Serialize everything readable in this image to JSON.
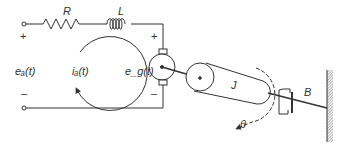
{
  "diagram": {
    "labels": {
      "resistor": "R",
      "inductor": "L",
      "input_voltage": "eₐ(t)",
      "armature_current": "iₐ(t)",
      "back_emf": "e_g(t)",
      "inertia": "J",
      "damping": "B",
      "angle": "θ"
    },
    "polarity": {
      "input_plus": "+",
      "input_minus": "–",
      "motor_plus": "+",
      "motor_minus": "–"
    },
    "colors": {
      "stroke": "#333333",
      "background": "#ffffff"
    }
  }
}
